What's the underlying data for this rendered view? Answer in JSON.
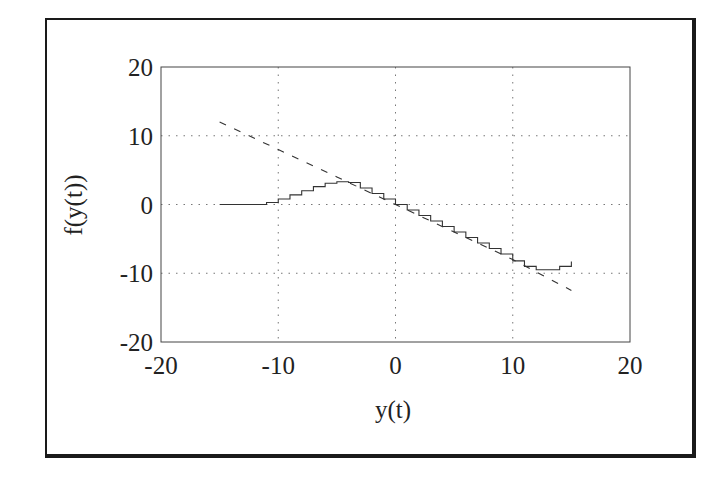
{
  "chart_data": {
    "type": "line",
    "title": "",
    "xlabel": "y(t)",
    "ylabel": "f(y(t))",
    "xlim": [
      -20,
      20
    ],
    "ylim": [
      -20,
      20
    ],
    "xticks": [
      -20,
      -10,
      0,
      10,
      20
    ],
    "yticks": [
      -20,
      -10,
      0,
      10,
      20
    ],
    "xtick_labels": [
      "-20",
      "-10",
      "0",
      "10",
      "20"
    ],
    "ytick_labels": [
      "-20",
      "-10",
      "0",
      "10",
      "20"
    ],
    "grid": true,
    "legend": null,
    "series": [
      {
        "name": "nonlinear response (solid, staircase)",
        "style": "solid",
        "x": [
          -15,
          -13,
          -12,
          -11,
          -10,
          -9,
          -8,
          -7,
          -6,
          -5,
          -4,
          -3,
          -2,
          -1,
          0,
          1,
          2,
          3,
          4,
          5,
          6,
          7,
          8,
          9,
          10,
          11,
          12,
          13,
          14,
          15
        ],
        "y": [
          0,
          0,
          0,
          0.3,
          0.8,
          1.4,
          2.0,
          2.6,
          3.1,
          3.3,
          3.2,
          2.4,
          1.6,
          0.8,
          0,
          -0.8,
          -1.6,
          -2.4,
          -3.2,
          -4.0,
          -4.8,
          -5.6,
          -6.4,
          -7.2,
          -8.2,
          -9.0,
          -9.5,
          -9.5,
          -9.0,
          -8.3
        ]
      },
      {
        "name": "linear reference (dashed)",
        "style": "dashed",
        "x": [
          -15,
          -10,
          -5,
          0,
          5,
          10,
          15
        ],
        "y": [
          12,
          8,
          4,
          0,
          -4,
          -8,
          -12.5
        ]
      }
    ]
  }
}
